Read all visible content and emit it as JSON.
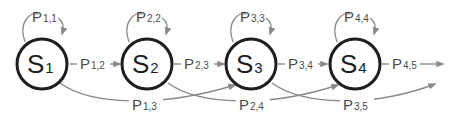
{
  "diagram": {
    "type": "markov-chain",
    "colors": {
      "node_stroke": "#1e1e1e",
      "edge": "#8a8a8a",
      "label": "#4a4a4a"
    },
    "states": [
      {
        "id": "S1",
        "letter": "S",
        "sub": "1"
      },
      {
        "id": "S2",
        "letter": "S",
        "sub": "2"
      },
      {
        "id": "S3",
        "letter": "S",
        "sub": "3"
      },
      {
        "id": "S4",
        "letter": "S",
        "sub": "4"
      }
    ],
    "self_loops": [
      {
        "letter": "P",
        "sub": "1,1"
      },
      {
        "letter": "P",
        "sub": "2,2"
      },
      {
        "letter": "P",
        "sub": "3,3"
      },
      {
        "letter": "P",
        "sub": "4,4"
      }
    ],
    "forward_edges": [
      {
        "letter": "P",
        "sub": "1,2"
      },
      {
        "letter": "P",
        "sub": "2,3"
      },
      {
        "letter": "P",
        "sub": "3,4"
      },
      {
        "letter": "P",
        "sub": "4,5"
      }
    ],
    "skip_edges": [
      {
        "letter": "P",
        "sub": "1,3"
      },
      {
        "letter": "P",
        "sub": "2,4"
      },
      {
        "letter": "P",
        "sub": "3,5"
      }
    ]
  }
}
